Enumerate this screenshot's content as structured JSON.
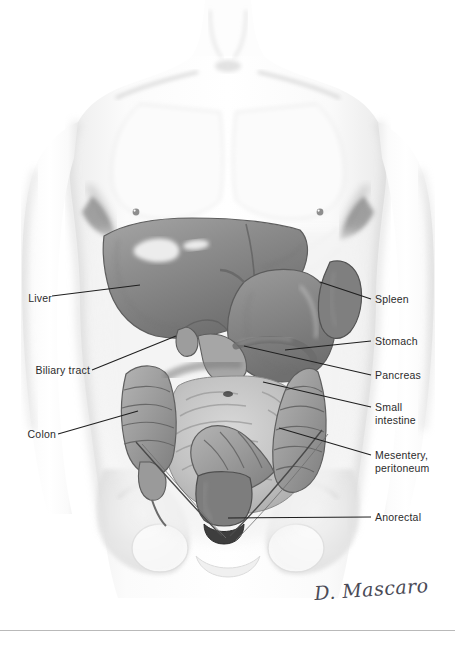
{
  "figure": {
    "medium": "grayscale watercolor and pencil anatomical illustration",
    "background_color": "#ffffff",
    "ink_color": "#2b2b2b",
    "organ_tone": "#8a8a8a"
  },
  "labels": {
    "left": [
      {
        "id": "liver",
        "text": "Liver",
        "x": 18,
        "y": 292,
        "leader_to_x": 140,
        "leader_to_y": 285
      },
      {
        "id": "biliary-tract",
        "text": "Biliary tract",
        "x": 18,
        "y": 366,
        "leader_to_x": 175,
        "leader_to_y": 336
      },
      {
        "id": "colon",
        "text": "Colon",
        "x": 18,
        "y": 430,
        "leader_to_x": 137,
        "leader_to_y": 411
      }
    ],
    "right": [
      {
        "id": "spleen",
        "text": "Spleen",
        "x": 375,
        "y": 295,
        "leader_to_x": 320,
        "leader_to_y": 282
      },
      {
        "id": "stomach",
        "text": "Stomach",
        "x": 375,
        "y": 337,
        "leader_to_x": 283,
        "leader_to_y": 350
      },
      {
        "id": "pancreas",
        "text": "Pancreas",
        "x": 375,
        "y": 371,
        "leader_to_x": 243,
        "leader_to_y": 345
      },
      {
        "id": "small-intestine",
        "text": "Small\nintestine",
        "x": 375,
        "y": 403,
        "leader_to_x": 262,
        "leader_to_y": 381
      },
      {
        "id": "mesentery",
        "text": "Mesentery,\nperitoneum",
        "x": 375,
        "y": 451,
        "leader_to_x": 278,
        "leader_to_y": 427
      },
      {
        "id": "anorectal",
        "text": "Anorectal",
        "x": 375,
        "y": 513,
        "leader_to_x": 228,
        "leader_to_y": 518
      }
    ]
  },
  "signature": {
    "text": "D. Mascaro"
  },
  "footer": {
    "caption": ""
  },
  "colors": {
    "ink": "#2b2b2b",
    "leader_line": "#1f1f1f",
    "rule": "#b9b9b9",
    "signature": "#4a4a56"
  }
}
